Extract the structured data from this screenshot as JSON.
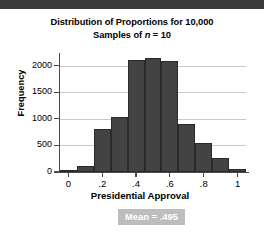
{
  "chart_data": {
    "type": "bar",
    "title": "Distribution of Proportions for 10,000 Samples of n = 10",
    "title_line1": "Distribution of Proportions for 10,000",
    "title_line2_prefix": "Samples of ",
    "title_line2_italic": "n",
    "title_line2_suffix": " = 10",
    "xlabel": "Presidential Approval",
    "ylabel": "Frequency",
    "categories": [
      "0",
      "0.1",
      "0.2",
      "0.3",
      "0.4",
      "0.5",
      "0.6",
      "0.7",
      "0.8",
      "0.9",
      "1"
    ],
    "values": [
      20,
      110,
      800,
      1040,
      2100,
      2150,
      2090,
      900,
      540,
      270,
      50
    ],
    "xlim": [
      -0.05,
      1.05
    ],
    "ylim": [
      0,
      2200
    ],
    "xticks": [
      "0",
      ".2",
      ".4",
      ".6",
      ".8",
      "1"
    ],
    "xtick_values": [
      0,
      0.2,
      0.4,
      0.6,
      0.8,
      1
    ],
    "yticks": [
      "0",
      "500",
      "1000",
      "1500",
      "2000"
    ],
    "ytick_values": [
      0,
      500,
      1000,
      1500,
      2000
    ],
    "grid": true,
    "legend": false,
    "bar_color": "#434343",
    "gridline_color": "#c9c9c9",
    "annotation": {
      "text": "Mean = .495",
      "background": "#bdbdbd",
      "color": "#ffffff"
    }
  }
}
